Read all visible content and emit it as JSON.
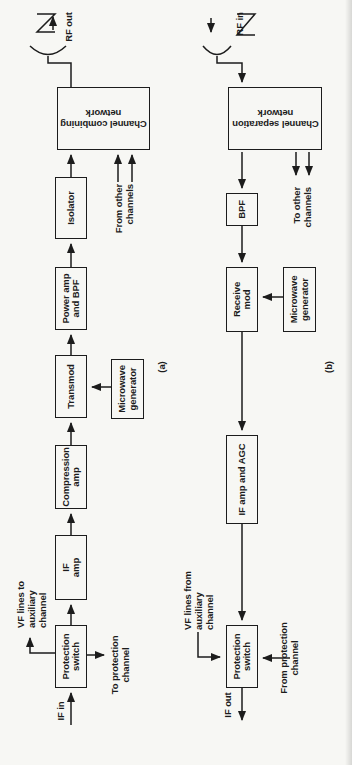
{
  "colors": {
    "ink": "#1c1c1c",
    "paper": "#f7f7f4"
  },
  "transmitter": {
    "caption": "(a)",
    "input_label": "IF in",
    "vf_lines_label": "VF lines to\nauxiliary\nchannel",
    "protection_switch": "Protection\nswitch",
    "to_protection_label": "To protection\nchannel",
    "if_amp": "IF\namp",
    "compression_amp": "Compression\namp",
    "transmod": "Transmod",
    "microwave_generator": "Microwave\ngenerator",
    "power_amp_bpf": "Power amp\nand BPF",
    "isolator": "Isolator",
    "combining_network": "Channel combining\nnetwork",
    "from_other_label": "From other\nchannels",
    "antenna_label": "RF out"
  },
  "receiver": {
    "caption": "(b)",
    "antenna_label": "RF in",
    "separation_network": "Channel separation\nnetwork",
    "to_other_label": "To other\nchannels",
    "bpf": "BPF",
    "receive_mod": "Receive\nmod",
    "microwave_generator": "Microwave\ngenerator",
    "if_amp_agc": "IF amp and AGC",
    "protection_switch": "Protection\nswitch",
    "vf_lines_label": "VF lines from\nauxiliary\nchannel",
    "from_protection_label": "From protection\nchannel",
    "output_label": "IF out"
  }
}
